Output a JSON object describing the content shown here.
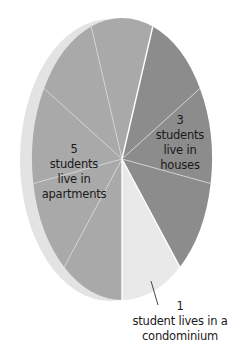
{
  "chart_data": {
    "type": "pie",
    "title": "",
    "categories": [
      "apartments",
      "houses",
      "condominium"
    ],
    "values": [
      5,
      3,
      1
    ],
    "units": "students",
    "total": 9,
    "style": "3D tilted ellipse, each student shown as a separate wedge",
    "series": [
      {
        "name": "apartments",
        "value": 5,
        "color": "#a9a9a9",
        "label_lines": [
          "5",
          "students",
          "live in",
          "apartments"
        ]
      },
      {
        "name": "houses",
        "value": 3,
        "color": "#8c8c8c",
        "label_lines": [
          "3",
          "students",
          "live in",
          "houses"
        ]
      },
      {
        "name": "condominium",
        "value": 1,
        "color": "#e9e9e9",
        "label_lines": [
          "1",
          "student lives in a",
          "condominium"
        ]
      }
    ],
    "colors": {
      "rim": "#e3e3e3",
      "divider": "#d6d6d6",
      "major_divider": "#ffffff",
      "pointer": "#333333"
    },
    "legend": "none",
    "grid": false
  }
}
